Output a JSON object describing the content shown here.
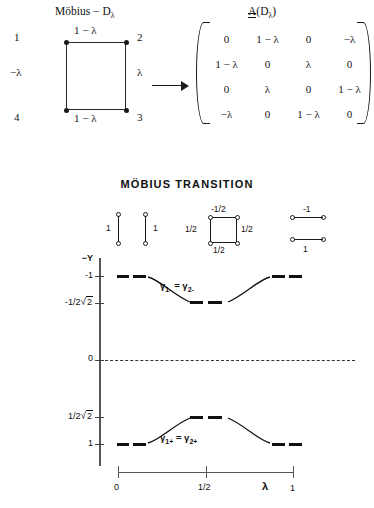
{
  "figure": {
    "graph_title": "Möbius − D",
    "graph_title_sub": "λ",
    "matrix_title_A": "A",
    "matrix_title_rest": "(D",
    "matrix_title_sub": "λ",
    "matrix_title_close": ")",
    "arrow": "→"
  },
  "square_graph": {
    "vertices": [
      {
        "id": "v1",
        "label": "1"
      },
      {
        "id": "v2",
        "label": "2"
      },
      {
        "id": "v3",
        "label": "3"
      },
      {
        "id": "v4",
        "label": "4"
      }
    ],
    "edges": [
      {
        "id": "top",
        "label": "1 − λ"
      },
      {
        "id": "left",
        "label": "−λ"
      },
      {
        "id": "right",
        "label": "λ"
      },
      {
        "id": "bottom",
        "label": "1 − λ"
      }
    ]
  },
  "matrix": {
    "rows": [
      [
        "0",
        "1 − λ",
        "0",
        "−λ"
      ],
      [
        "1 − λ",
        "0",
        "λ",
        "0"
      ],
      [
        "0",
        "λ",
        "0",
        "1 − λ"
      ],
      [
        "−λ",
        "0",
        "1 − λ",
        "0"
      ]
    ]
  },
  "transition": {
    "title": "MÖBIUS TRANSITION",
    "mini_graphs": [
      {
        "id": "mg1",
        "type": "two-vertex-vertical-edge",
        "labels": [
          "1"
        ]
      },
      {
        "id": "mg2",
        "type": "two-vertex-vertical-edge",
        "labels": [
          "1"
        ]
      },
      {
        "id": "mg3",
        "type": "square",
        "labels": {
          "top": "-1/2",
          "left": "1/2",
          "right": "1/2",
          "bottom": "1/2"
        }
      },
      {
        "id": "mg4",
        "type": "two-horizontal-edges",
        "labels": {
          "top": "-1",
          "bottom": "1"
        }
      }
    ]
  },
  "chart_data": {
    "type": "line",
    "title": "MÖBIUS TRANSITION",
    "xlabel": "λ",
    "ylabel": "−Y",
    "xlim": [
      0,
      1
    ],
    "ylim": [
      -1,
      1
    ],
    "y_inverted": true,
    "grid": false,
    "x_ticks": [
      {
        "value": 0,
        "label": "0"
      },
      {
        "value": 0.5,
        "label": "1/2"
      },
      {
        "value": 1,
        "label": "1"
      }
    ],
    "y_ticks": [
      {
        "value": -1,
        "label": "-1"
      },
      {
        "value": -0.7071,
        "label": "-1/2√2"
      },
      {
        "value": 0,
        "label": "0"
      },
      {
        "value": 0.7071,
        "label": "1/2√2"
      },
      {
        "value": 1,
        "label": "1"
      }
    ],
    "zero_line": {
      "value": 0,
      "style": "dashed"
    },
    "series": [
      {
        "name": "γ1− = γ2−",
        "label": "γ1- = γ2-",
        "style": "curve-with-dashed-plateaus",
        "points": [
          {
            "x": 0.0,
            "y": -1.0
          },
          {
            "x": 0.12,
            "y": -1.0
          },
          {
            "x": 0.25,
            "y": -0.93
          },
          {
            "x": 0.375,
            "y": -0.78
          },
          {
            "x": 0.5,
            "y": -0.7071
          },
          {
            "x": 0.625,
            "y": -0.78
          },
          {
            "x": 0.75,
            "y": -0.93
          },
          {
            "x": 0.88,
            "y": -1.0
          },
          {
            "x": 1.0,
            "y": -1.0
          }
        ]
      },
      {
        "name": "γ1+ = γ2+",
        "label": "γ1+ = γ2+",
        "style": "curve-with-dashed-plateaus",
        "points": [
          {
            "x": 0.0,
            "y": 1.0
          },
          {
            "x": 0.12,
            "y": 1.0
          },
          {
            "x": 0.25,
            "y": 0.93
          },
          {
            "x": 0.375,
            "y": 0.78
          },
          {
            "x": 0.5,
            "y": 0.7071
          },
          {
            "x": 0.625,
            "y": 0.78
          },
          {
            "x": 0.75,
            "y": 0.93
          },
          {
            "x": 0.88,
            "y": 1.0
          },
          {
            "x": 1.0,
            "y": 1.0
          }
        ]
      }
    ],
    "annotations": [
      {
        "text": "γ1- = γ2-",
        "x": 0.3,
        "y": -0.9
      },
      {
        "text": "γ1+ = γ2+",
        "x": 0.3,
        "y": 0.9
      }
    ]
  }
}
